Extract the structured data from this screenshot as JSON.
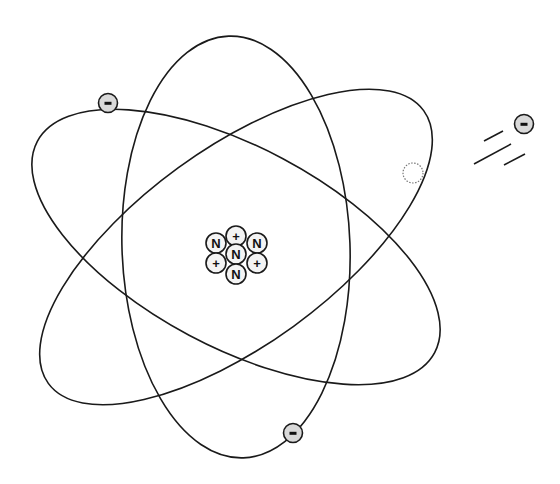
{
  "diagram": {
    "type": "atom-model",
    "nucleus": {
      "particles": [
        {
          "label": "+",
          "kind": "proton",
          "cx": 236,
          "cy": 236
        },
        {
          "label": "N",
          "kind": "neutron",
          "cx": 216,
          "cy": 243
        },
        {
          "label": "N",
          "kind": "neutron",
          "cx": 257,
          "cy": 243
        },
        {
          "label": "N",
          "kind": "neutron",
          "cx": 236,
          "cy": 254
        },
        {
          "label": "+",
          "kind": "proton",
          "cx": 216,
          "cy": 263
        },
        {
          "label": "+",
          "kind": "proton",
          "cx": 257,
          "cy": 263
        },
        {
          "label": "N",
          "kind": "neutron",
          "cx": 236,
          "cy": 274
        }
      ]
    },
    "orbits": [
      {
        "name": "vertical-orbit",
        "cx": 236,
        "cy": 247,
        "rx": 114,
        "ry": 211,
        "rotate": -2
      },
      {
        "name": "descending-orbit",
        "cx": 236,
        "cy": 247,
        "rx": 225,
        "ry": 100,
        "rotate": 28
      },
      {
        "name": "ascending-orbit",
        "cx": 236,
        "cy": 247,
        "rx": 232,
        "ry": 98,
        "rotate": -36
      }
    ],
    "electrons": [
      {
        "label": "-",
        "cx": 108,
        "cy": 103,
        "name": "electron-upper-left"
      },
      {
        "label": "-",
        "cx": 293,
        "cy": 433,
        "name": "electron-bottom"
      }
    ],
    "vacancy": {
      "cx": 413,
      "cy": 173,
      "r": 10
    },
    "free_electron": {
      "label": "-",
      "cx": 524,
      "cy": 124
    },
    "colors": {
      "stroke": "#1a1a1a",
      "electron_fill": "#d9d9d9",
      "background": "#ffffff"
    }
  }
}
